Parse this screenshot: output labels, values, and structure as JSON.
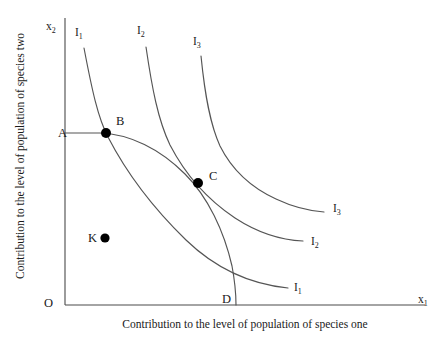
{
  "figure": {
    "type": "economics-ppf-indifference-diagram",
    "background_color": "#ffffff",
    "line_color": "#555555",
    "axis_color": "#4a4a4a",
    "marker_color": "#000000"
  },
  "axes": {
    "x_variable": "x",
    "x_variable_subscript": "1",
    "y_variable": "x",
    "y_variable_subscript": "2",
    "origin_label": "O",
    "x_caption": "Contribution to the level of population of species one",
    "y_caption": "Contribution to the level of population of species two"
  },
  "points": [
    {
      "label": "A",
      "x": 65,
      "y": 133,
      "has_dot": false,
      "label_x": 58,
      "label_y": 137
    },
    {
      "label": "B",
      "x": 106,
      "y": 133,
      "has_dot": true,
      "label_x": 116,
      "label_y": 125
    },
    {
      "label": "C",
      "x": 198,
      "y": 183,
      "has_dot": true,
      "label_x": 209,
      "label_y": 180
    },
    {
      "label": "D",
      "x": 236,
      "y": 305,
      "has_dot": false,
      "label_x": 222,
      "label_y": 303
    },
    {
      "label": "K",
      "x": 105,
      "y": 238,
      "has_dot": true,
      "label_x": 88,
      "label_y": 242
    }
  ],
  "curves": [
    {
      "name": "indifference-curve-1",
      "label": "I",
      "subscript": "1",
      "top_label_x": 75,
      "top_label_y": 36,
      "end_label_x": 294,
      "end_label_y": 291,
      "path": "M 84,48 C 92,90 98,118 108,137 C 124,168 150,205 186,240 C 215,268 248,284 288,288"
    },
    {
      "name": "indifference-curve-2",
      "label": "I",
      "subscript": "2",
      "top_label_x": 137,
      "top_label_y": 34,
      "end_label_x": 311,
      "end_label_y": 245,
      "path": "M 146,47 C 152,88 158,120 170,145 C 184,172 205,198 235,218 C 258,233 280,240 303,241"
    },
    {
      "name": "indifference-curve-3",
      "label": "I",
      "subscript": "3",
      "top_label_x": 193,
      "top_label_y": 45,
      "end_label_x": 333,
      "end_label_y": 212,
      "path": "M 201,56 C 205,96 210,124 220,146 C 232,170 252,188 276,199 C 293,207 310,211 324,212"
    }
  ],
  "ppf": {
    "name": "production-possibility-frontier",
    "path": "M 65,133 L 100,133 C 130,134 160,149 185,174 C 208,197 224,231 232,266 C 235,282 236,295 236,305"
  },
  "feasible_region_point": "K"
}
